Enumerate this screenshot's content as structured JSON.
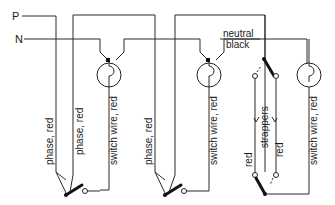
{
  "diagram": {
    "title": "",
    "bus_labels": {
      "phase": "P",
      "neutral": "N"
    },
    "neutral_annotation": {
      "line1": "neutral",
      "line2": "black"
    },
    "labels": {
      "phase_red_1": "phase, red",
      "phase_red_2": "phase, red",
      "phase_red_3": "phase, red",
      "switch_wire_1": "switch wire, red",
      "switch_wire_2": "switch wire, red",
      "switch_wire_3": "switch wire, red",
      "strappers": "strappers",
      "strapper_left": "red",
      "strapper_right": "red"
    },
    "components": [
      {
        "type": "lamp",
        "id": "lamp-1"
      },
      {
        "type": "lamp",
        "id": "lamp-2"
      },
      {
        "type": "lamp",
        "id": "lamp-3"
      },
      {
        "type": "one-way-switch",
        "id": "switch-1"
      },
      {
        "type": "one-way-switch",
        "id": "switch-2"
      },
      {
        "type": "two-way-switch",
        "id": "switch-3-top"
      },
      {
        "type": "two-way-switch",
        "id": "switch-3-bottom"
      }
    ],
    "colors": {
      "line": "#2a2a2a",
      "background": "#ffffff"
    }
  }
}
